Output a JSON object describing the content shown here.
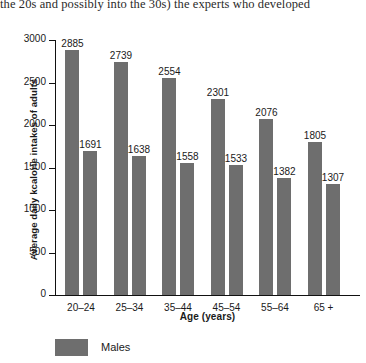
{
  "excerpt": {
    "text": "the 20s and possibly into the 30s) the experts who developed"
  },
  "chart_data": {
    "type": "bar",
    "title": "",
    "xlabel": "Age (years)",
    "ylabel": "Average daily kcalorie intakes of adults",
    "categories": [
      "20–24",
      "25–34",
      "35–44",
      "45–54",
      "55–64",
      "65 +"
    ],
    "series": [
      {
        "name": "Males",
        "values": [
          2885,
          2739,
          2554,
          2301,
          2076,
          1805
        ]
      },
      {
        "name": "Females",
        "values": [
          1691,
          1638,
          1558,
          1533,
          1382,
          1307
        ]
      }
    ],
    "ylim": [
      0,
      3000
    ],
    "yticks": [
      0,
      500,
      1000,
      1500,
      2000,
      2500,
      3000
    ],
    "ytick_labels": [
      "0",
      "500",
      "1000",
      "1500",
      "2000",
      "2500",
      "3000"
    ],
    "grid": false,
    "legend_position": "bottom-left",
    "bar_color": "#6e6e6e",
    "axis_color": "#111111",
    "data_labels": true
  },
  "legend": {
    "items": [
      {
        "label": "Males",
        "color": "#6e6e6e"
      }
    ]
  }
}
